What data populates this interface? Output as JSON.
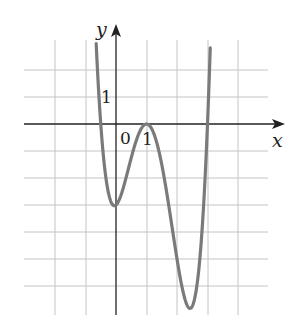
{
  "chart_data": {
    "type": "line",
    "title": "",
    "xlabel": "x",
    "ylabel": "y",
    "origin_label": "0",
    "x_tick_label": "1",
    "y_tick_label": "1",
    "xlim": [
      -3,
      5.5
    ],
    "ylim": [
      -7,
      3
    ],
    "grid": true,
    "grid_x": [
      -2,
      -1,
      0,
      1,
      2,
      3,
      4
    ],
    "grid_y": [
      2,
      1,
      0,
      -1,
      -2,
      -3,
      -4,
      -5,
      -6
    ],
    "series": [
      {
        "name": "f(x)",
        "description": "quartic with local min at (0,-3), local max touching x-axis at (1,0), global min near (2.3,-6.7), roots near x=-0.5 and x=3",
        "x": [
          -0.65,
          -0.5,
          -0.25,
          0,
          0.25,
          0.5,
          0.75,
          1,
          1.25,
          1.5,
          1.75,
          2,
          2.25,
          2.5,
          2.75,
          3,
          3.1
        ],
        "y": [
          2.8,
          0,
          -2.0,
          -3.0,
          -2.6,
          -1.5,
          -0.5,
          0,
          -0.6,
          -2.0,
          -3.9,
          -5.5,
          -6.6,
          -6.5,
          -4.5,
          0,
          2.9
        ]
      }
    ],
    "colors": {
      "curve": "#7a7a7a",
      "axes": "#222222",
      "grid": "#bdbdbd"
    }
  }
}
